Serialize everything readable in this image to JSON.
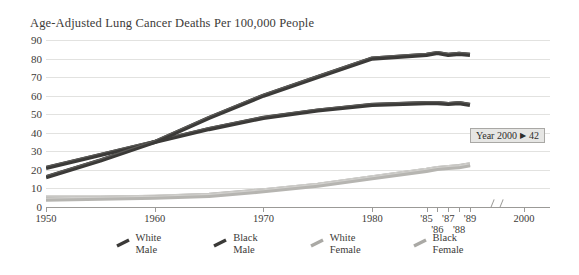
{
  "chart_data": {
    "type": "line",
    "title": "Age-Adjusted Lung Cancer Deaths Per 100,000 People",
    "xlabel": "",
    "ylabel": "",
    "ylim": [
      0,
      90
    ],
    "yticks": [
      0,
      10,
      20,
      30,
      40,
      50,
      60,
      70,
      80,
      90
    ],
    "grid": true,
    "legend_position": "bottom",
    "xticks": [
      "1950",
      "1960",
      "1970",
      "1980",
      "'85",
      "'86",
      "'87",
      "'88",
      "'89",
      "2000"
    ],
    "x_axis_break_before": "2000",
    "x": [
      1950,
      1955,
      1960,
      1965,
      1970,
      1975,
      1980,
      1985,
      1986,
      1987,
      1988,
      1989
    ],
    "series": [
      {
        "name": "White Male",
        "color": "#3b3a38",
        "values": [
          21,
          28,
          35,
          42,
          48,
          52,
          55,
          56,
          56,
          55.5,
          56,
          55
        ]
      },
      {
        "name": "Black Male",
        "color": "#3b3a38",
        "values": [
          16,
          25,
          35,
          48,
          60,
          70,
          80,
          82,
          83,
          82,
          82.5,
          82
        ]
      },
      {
        "name": "White Female",
        "color": "#a9a8a4",
        "values": [
          5,
          5,
          5.5,
          6.5,
          9,
          12,
          16,
          20,
          21,
          21.5,
          22,
          23
        ]
      },
      {
        "name": "Black Female",
        "color": "#b6b5b1",
        "values": [
          4,
          4.5,
          5,
          6,
          8.5,
          11.5,
          15.5,
          19.5,
          20.5,
          21,
          21.5,
          22.5
        ]
      }
    ]
  },
  "tooltip": {
    "label": "Year 2000",
    "arrow": "▶",
    "value": "42"
  },
  "legend": {
    "items": [
      {
        "line1": "White",
        "line2": "Male",
        "color": "#3b3a38"
      },
      {
        "line1": "Black",
        "line2": "Male",
        "color": "#3b3a38"
      },
      {
        "line1": "White",
        "line2": "Female",
        "color": "#aaa9a5"
      },
      {
        "line1": "Black",
        "line2": "Female",
        "color": "#aaa9a5"
      }
    ]
  }
}
